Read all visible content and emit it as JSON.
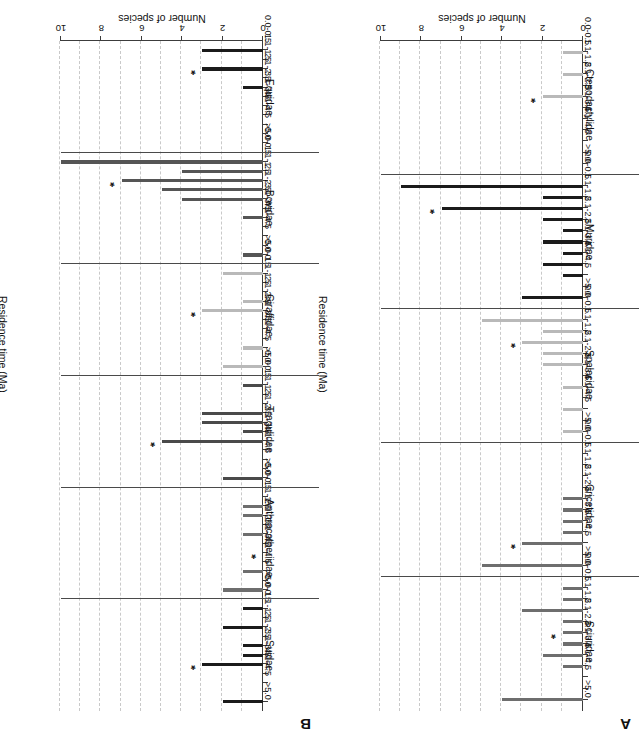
{
  "figure": {
    "value_axis_title": "Number of species",
    "category_axis_title": "Residence time (Ma)",
    "value_ticks": [
      "0",
      "2",
      "4",
      "6",
      "8",
      "10"
    ],
    "bin_labels": [
      "0.0-0.5",
      "1.1-1.5",
      "2.1-2.5",
      "3.1-3.5",
      "4.1-4.5",
      ">5.0"
    ],
    "star_symbol": "*",
    "colors": {
      "axis": "#3c3c3c",
      "grid": "#c9c9c9",
      "separator": "#4a4a4a",
      "bar_dark": "#1b1b1b",
      "bar_mid": "#6e6e6e",
      "bar_light": "#b9b9b9"
    }
  },
  "chart_data": {
    "type": "bar",
    "title": "",
    "xlabel": "Residence time (Ma)",
    "ylabel": "Number of species",
    "ylim": [
      0,
      10
    ],
    "yticks": [
      0,
      2,
      4,
      6,
      8,
      10
    ],
    "grid": true,
    "legend": "none",
    "orientation": "horizontal",
    "bin_edges_ma": [
      "0.0-0.5",
      "0.6-1.0",
      "1.1-1.5",
      "1.6-2.0",
      "2.1-2.5",
      "2.6-3.0",
      "3.1-3.5",
      "3.6-4.0",
      "4.1-4.5",
      "4.6-5.0",
      ">5.0"
    ],
    "annotation_note": "Asterisk marks the mean residence time bin for each family",
    "panels": [
      {
        "letter": "A",
        "families": [
          {
            "name": "Sciuridae",
            "color": "#6e6e6e",
            "values": [
              1,
              1,
              3,
              1,
              1,
              1,
              2,
              1,
              0,
              0,
              4
            ],
            "star_bin_index": 4
          },
          {
            "name": "Cricetidae",
            "color": "#6e6e6e",
            "values": [
              0,
              0,
              0,
              0,
              1,
              1,
              1,
              1,
              3,
              0,
              5
            ],
            "star_bin_index": 8
          },
          {
            "name": "Spalacidae",
            "color": "#b9b9b9",
            "values": [
              5,
              2,
              3,
              2,
              2,
              0,
              1,
              0,
              1,
              0,
              1
            ],
            "star_bin_index": 2
          },
          {
            "name": "Muridae",
            "color": "#1b1b1b",
            "values": [
              9,
              2,
              7,
              2,
              1,
              2,
              1,
              2,
              1,
              0,
              3
            ],
            "star_bin_index": 2
          },
          {
            "name": "Ctenodactylidae",
            "color": "#b9b9b9",
            "values": [
              1,
              0,
              1,
              0,
              2,
              0,
              0,
              0,
              0,
              0,
              0
            ],
            "star_bin_index": 4
          }
        ]
      },
      {
        "letter": "B",
        "families": [
          {
            "name": "Suidae",
            "color": "#1b1b1b",
            "values": [
              1,
              0,
              2,
              0,
              1,
              1,
              3,
              0,
              0,
              0,
              2
            ],
            "star_bin_index": 6
          },
          {
            "name": "Anthracotheriidae",
            "color": "#6e6e6e",
            "values": [
              0,
              1,
              1,
              0,
              1,
              0,
              0,
              0,
              1,
              0,
              2
            ],
            "star_bin_index": 6
          },
          {
            "name": "Tragulidae",
            "color": "#4a4a4a",
            "values": [
              1,
              0,
              0,
              3,
              3,
              1,
              5,
              0,
              0,
              0,
              2
            ],
            "star_bin_index": 6
          },
          {
            "name": "Giraffidae",
            "color": "#b9b9b9",
            "values": [
              2,
              0,
              0,
              1,
              3,
              0,
              0,
              0,
              1,
              0,
              2
            ],
            "star_bin_index": 4
          },
          {
            "name": "Bovidae",
            "color": "#555555",
            "values": [
              10,
              4,
              7,
              5,
              4,
              0,
              1,
              0,
              0,
              0,
              1
            ],
            "star_bin_index": 2
          },
          {
            "name": "Equidae",
            "color": "#1b1b1b",
            "values": [
              3,
              0,
              3,
              0,
              1,
              0,
              0,
              0,
              0,
              0,
              0
            ],
            "star_bin_index": 2
          }
        ]
      }
    ]
  }
}
